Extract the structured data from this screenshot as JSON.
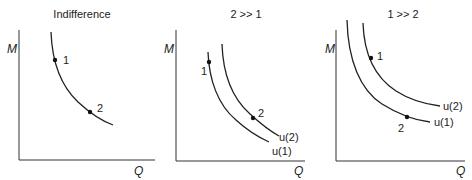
{
  "panels": [
    {
      "title": "Indifference",
      "y_axis_label": "M",
      "x_axis_label": "Q",
      "points": [
        {
          "label": "1"
        },
        {
          "label": "2"
        }
      ],
      "curves": []
    },
    {
      "title": "2 >> 1",
      "y_axis_label": "M",
      "x_axis_label": "Q",
      "points": [
        {
          "label": "1"
        },
        {
          "label": "2"
        }
      ],
      "curves": [
        {
          "label": "u(2)"
        },
        {
          "label": "u(1)"
        }
      ]
    },
    {
      "title": "1 >> 2",
      "y_axis_label": "M",
      "x_axis_label": "Q",
      "points": [
        {
          "label": "1"
        },
        {
          "label": "2"
        }
      ],
      "curves": [
        {
          "label": "u(2)"
        },
        {
          "label": "u(1)"
        }
      ]
    }
  ],
  "colors": {
    "ink": "#222222",
    "background": "#ffffff"
  }
}
